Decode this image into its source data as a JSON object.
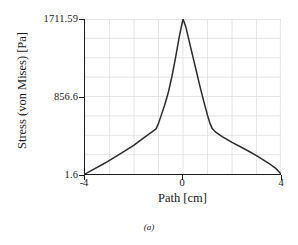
{
  "figure": {
    "caption": "(a)"
  },
  "axes": {
    "y": {
      "title": "Stress (von Mises) [Pa]",
      "ticks": [
        "1711.59",
        "856.6",
        "1.6"
      ]
    },
    "x": {
      "title": "Path [cm]",
      "ticks": [
        "-4",
        "0",
        "4"
      ]
    }
  },
  "style": {
    "curve_color": "#2b2b2b",
    "axis_color": "#1c1c1c",
    "grid_color": "#dcdcdc",
    "background": "#ffffff"
  },
  "chart_data": {
    "type": "line",
    "title": "",
    "xlabel": "Path [cm]",
    "ylabel": "Stress (von Mises) [Pa]",
    "xlim": [
      -4,
      4
    ],
    "ylim": [
      1.6,
      1711.59
    ],
    "xticks": [
      -4,
      0,
      4
    ],
    "yticks": [
      1.6,
      856.6,
      1711.59
    ],
    "grid": true,
    "legend": null,
    "series": [
      {
        "name": "Stress (von Mises)",
        "x": [
          -4.0,
          -3.6,
          -3.2,
          -2.8,
          -2.4,
          -2.0,
          -1.7,
          -1.45,
          -1.25,
          -1.1,
          -1.0,
          -0.9,
          -0.75,
          -0.6,
          -0.45,
          -0.3,
          -0.15,
          0.0,
          0.12,
          0.25,
          0.4,
          0.55,
          0.7,
          0.85,
          1.0,
          1.1,
          1.2,
          1.35,
          1.6,
          2.0,
          2.5,
          3.0,
          3.5,
          3.8,
          4.0
        ],
        "y": [
          1.6,
          60,
          120,
          185,
          250,
          320,
          380,
          430,
          470,
          500,
          560,
          640,
          760,
          900,
          1080,
          1290,
          1520,
          1711.59,
          1620,
          1470,
          1300,
          1130,
          960,
          800,
          650,
          560,
          500,
          460,
          415,
          350,
          280,
          205,
          120,
          60,
          1.6
        ]
      }
    ]
  }
}
